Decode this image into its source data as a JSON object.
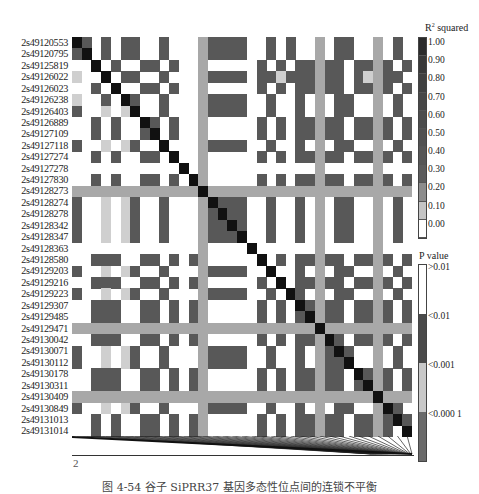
{
  "chart_data": {
    "type": "heatmap",
    "title": "",
    "caption": "图 4-54  谷子 SiPRR37 基因多态性位点间的连锁不平衡",
    "xlabel": "2",
    "loci": [
      "2s49120553",
      "2s49120795",
      "2s49125819",
      "2s49126022",
      "2s49126023",
      "2s49126238",
      "2s49126403",
      "2s49126889",
      "2s49127109",
      "2s49127118",
      "2s49127274",
      "2s49127278",
      "2s49127830",
      "2s49128273",
      "2s49128274",
      "2s49128278",
      "2s49128342",
      "2s49128347",
      "2s49128363",
      "2s49128580",
      "2s49129203",
      "2s49129216",
      "2s49129223",
      "2s49129307",
      "2s49129485",
      "2s49129471",
      "2s49130042",
      "2s49130071",
      "2s49130112",
      "2s49130178",
      "2s49130311",
      "2s49130409",
      "2s49130849",
      "2s49131013",
      "2s49131014"
    ],
    "cell_codes_legend": {
      "K": "diagonal / R2 ~1.00",
      "D": "R2 high (dark gray)",
      "G": "band (light gray, ~0.20)",
      "L": "R2 low (~0.10)",
      "W": "R2 0.00 (white)"
    },
    "rows": [
      "KDWDWDDWWDWWWGDDDDWWDWDWWGWDDWWGWDW",
      "DKWDWDDWWDWWWGDDDDWWDWDWWGWDDWWGWDW",
      "WWKWDWWDDWDWWGWWWWWDWDWDDGDDWDDGDWD",
      "LWWKWDDWWDWWWGDDDDWDDLDDDGDDWDLGDDW",
      "WWDWKWWDDWDWWGWWWWWDWDWDDGDDWDDGDWD",
      "LWWDWKDWWDWWWGDDDDWWDWWDWGWDDWWGWDW",
      "DWWLWLKWWDWWWGDDDDWWDWWDWGWDDWWGWDW",
      "WWDWDWWKDWDWWGWWWWWDWDWDDGDDWDDGDWD",
      "WWDWDWWDKWDWWGWWWWWDWDWDDGDDWDDGDWD",
      "DWWLWLDWWKWWWGDDDDWWDWWDWGWDDWWGWDW",
      "WWDWDWWDDWKWWGWWWWWDWDWDDGDDWDDGDWD",
      "WWWWWWWWWWWKWGWWWWWWWWWWWGWWWWWGWWW",
      "WWDWDWWDDWDWKGWWWWWDWDWDDGDDWDDGDWD",
      "GGGGGGGGGGGGGKGGGGGGGGGGGGGGGGGGGGG",
      "DWWLWLDWWDWWWGKDDDWWDWWDWGWDDWWGWDW",
      "DWWLWLDWWDWWWGDKDDWWDWWDWGWDDWWGWDW",
      "DWWLWLDWWDWWWGDDKDWWDWWDWGWDDWWGWDW",
      "DWWLWLDWWDWWWGDDDKWWDWWDWGWDDWWGWDW",
      "WWWWWWWWWWWWWGWWWWKWWWWWWGWWWWWGWWW",
      "WWDDDWWDDWDWDGWWWWWKWDWDDGDDWDDGDWD",
      "DWWLWLDWWDWWWGDDDDWWKWWDWGWDDWWGWDW",
      "WWDDDWWDDWDWDGWWWWWDWKWDDGDDWDDGDWD",
      "DWWLWLDWWDWWWGDDDDWWDWKDWGWDDWWGWDW",
      "WWDDDWWDDWDWDGWWWWWDWDWKDGDDWDDGDWD",
      "WWDDDWWDDWDWDGWWWWWDWDWDKGDDWDDGDWD",
      "GGGGGGGGGGGGGGGGGGGGGGGGGKGGGGGGGGG",
      "WWDDDWWDDWDWDGWWWWWDWDWDDGKDWDDGDWD",
      "DWWLWLDWWDWWWGDDDDWWDWWDWGDKDWWGWDW",
      "DWWLWLDWWDWWWGDDDDWWDWWDWGDDKWWGWDW",
      "WWDDDWWDDWDWDGWWWWWDWDWDDGDDWKDGDWD",
      "WWDDDWWDDWDWDGWWWWWDWDWDDGDDWDKGDWD",
      "GGGGGGGGGGGGGGGGGGGGGGGGGGGGGGGKGGG",
      "DWWLWLDWWDWWWGDDDDWWDWWDWGWDDWWGKDW",
      "WWDWDWWDDWDWDGWWWWWDWDWDDGDDWDDGDKD",
      "WWDWDWWDDWDWDGWWWWWDWDWDDGDDWDDGDWK"
    ],
    "legend_r2": {
      "title": "R² squared",
      "ticks": [
        "1.00",
        "0.90",
        "0.80",
        "0.70",
        "0.60",
        "0.50",
        "0.40",
        "0.30",
        "0.20",
        "0.10",
        "0.00"
      ],
      "colors": [
        "#2b2b2b",
        "#383838",
        "#404040",
        "#474747",
        "#4c4c4c",
        "#515151",
        "#565656",
        "#5c5c5c",
        "#8c8c8c",
        "#c4c4c4",
        "#ffffff"
      ]
    },
    "legend_p": {
      "title": "P value",
      "ticks": [
        ">0.01",
        "<0.01",
        "<0.001",
        "<0.000 1"
      ],
      "colors": [
        "#ffffff",
        "#4a4a4a",
        "#c8c8c8",
        "#6a6a6a"
      ]
    },
    "colors": {
      "K": "#111111",
      "D": "#585858",
      "G": "#a8a8a8",
      "L": "#cfcfcf",
      "W": "#ffffff"
    }
  }
}
